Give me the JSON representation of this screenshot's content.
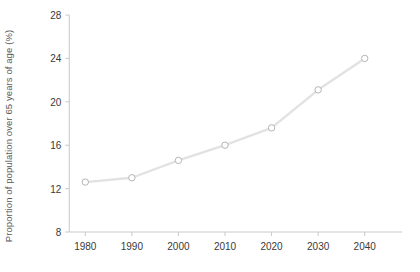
{
  "chart_data": {
    "type": "line",
    "title": "",
    "subtitle": "",
    "xlabel": "",
    "ylabel": "Proportion of population over 65 years of age (%)",
    "x": [
      1980,
      1990,
      2000,
      2010,
      2020,
      2030,
      2040
    ],
    "values": [
      12.6,
      13.0,
      14.6,
      16.0,
      17.6,
      21.1,
      24.0
    ],
    "series": [
      {
        "name": "Proportion of population over 65 years of age",
        "values": [
          12.6,
          13.0,
          14.6,
          16.0,
          17.6,
          21.1,
          24.0
        ]
      }
    ],
    "xtick_labels": [
      "1980",
      "1990",
      "2000",
      "2010",
      "2020",
      "2030",
      "2040"
    ],
    "ytick_labels": [
      "8",
      "12",
      "16",
      "20",
      "24",
      "28"
    ],
    "yticks": [
      8,
      12,
      16,
      20,
      24,
      28
    ],
    "xlim": [
      1975,
      2045
    ],
    "ylim": [
      8,
      28
    ],
    "grid": false,
    "legend": false,
    "legend_position": "none",
    "marker": "open-circle",
    "line_color": "#e2e2e2",
    "marker_color": "#b5b5b5",
    "axis_color": "#c9c9c9",
    "text_color": "#3a3a3a",
    "background": "#ffffff",
    "annotations": []
  }
}
